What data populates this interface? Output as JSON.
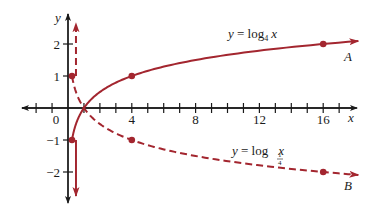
{
  "chart_data": {
    "type": "line",
    "title": "",
    "xlabel": "x",
    "ylabel": "y",
    "xlim": [
      -2.8,
      18
    ],
    "ylim": [
      -2.9,
      2.9
    ],
    "grid": false,
    "x_ticks": [
      -2,
      -1,
      0,
      1,
      2,
      3,
      4,
      5,
      6,
      7,
      8,
      9,
      10,
      11,
      12,
      13,
      14,
      15,
      16,
      17
    ],
    "x_tick_labels": [
      {
        "value": 0,
        "label": "0"
      },
      {
        "value": 4,
        "label": "4"
      },
      {
        "value": 8,
        "label": "8"
      },
      {
        "value": 12,
        "label": "12"
      },
      {
        "value": 16,
        "label": "16"
      }
    ],
    "y_ticks": [
      -2,
      -1,
      1,
      2
    ],
    "y_tick_labels": [
      {
        "value": 2,
        "label": "2"
      },
      {
        "value": 1,
        "label": "1"
      },
      {
        "value": -1,
        "label": "−1"
      },
      {
        "value": -2,
        "label": "−2"
      }
    ],
    "series": [
      {
        "name": "A",
        "label": "y = log₄ x",
        "equation_main": "y = log",
        "equation_sub": "4",
        "equation_var": "x",
        "style": "solid",
        "color": "#a3262f",
        "base": 4,
        "points": [
          {
            "x": 0.25,
            "y": -1
          },
          {
            "x": 4,
            "y": 1
          },
          {
            "x": 16,
            "y": 2
          }
        ]
      },
      {
        "name": "B",
        "label": "y = log₁/₄ x",
        "equation_main": "y = log",
        "equation_sub_num": "1",
        "equation_sub_den": "4",
        "equation_var": "x",
        "style": "dashed",
        "color": "#a3262f",
        "base": 0.25,
        "points": [
          {
            "x": 0.25,
            "y": 1
          },
          {
            "x": 4,
            "y": -1
          },
          {
            "x": 16,
            "y": -2
          }
        ]
      }
    ],
    "annotations": [
      "A",
      "B"
    ]
  },
  "axis": {
    "x_label": "x",
    "y_label": "y",
    "axis_color": "#1a1a1a"
  }
}
